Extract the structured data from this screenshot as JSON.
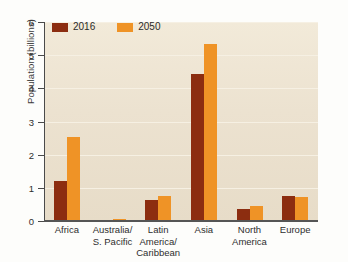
{
  "chart_data": {
    "type": "bar",
    "title": "",
    "xlabel": "",
    "ylabel": "Population (billions)",
    "ylim": [
      0,
      6
    ],
    "yticks": [
      0,
      1,
      2,
      3,
      4,
      5,
      6
    ],
    "ytick_labels": [
      "0",
      "1",
      "2",
      "3",
      "4",
      "5",
      "6"
    ],
    "grid": true,
    "legend_position": "top-left",
    "categories": [
      "Africa",
      "Australia/\nS. Pacific",
      "Latin America/\nCaribbean",
      "Asia",
      "North\nAmerica",
      "Europe"
    ],
    "series": [
      {
        "name": "2016",
        "color": "#8c2d10",
        "values": [
          1.22,
          0.04,
          0.64,
          4.44,
          0.36,
          0.74
        ]
      },
      {
        "name": "2050",
        "color": "#ef9326",
        "values": [
          2.52,
          0.06,
          0.76,
          5.33,
          0.45,
          0.72
        ]
      }
    ]
  },
  "colors": {
    "series_2016": "#8c2d10",
    "series_2050": "#ef9326",
    "plot_background": "#ece2d0",
    "gridline": "#f6f0e3",
    "axis": "#4a4a4a",
    "page_background": "#fdfdfb"
  },
  "legend": {
    "items": [
      {
        "label": "2016",
        "color": "#8c2d10"
      },
      {
        "label": "2050",
        "color": "#ef9326"
      }
    ]
  }
}
